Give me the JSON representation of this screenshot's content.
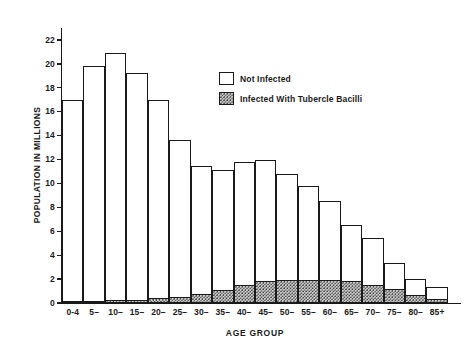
{
  "chart_data": {
    "type": "bar",
    "stacked": true,
    "title": "",
    "xlabel": "AGE GROUP",
    "ylabel": "POPULATION IN MILLIONS",
    "ylim": [
      0,
      23
    ],
    "yticks": [
      0,
      2,
      4,
      6,
      8,
      10,
      12,
      14,
      16,
      18,
      20,
      22
    ],
    "ytick_labels": [
      "0",
      "2",
      "4",
      "6",
      "8",
      "10",
      "12",
      "14",
      "16",
      "18",
      "20",
      "22"
    ],
    "grid": false,
    "legend_position": "upper-center-right",
    "categories": [
      "0-4",
      "5–",
      "10–",
      "15–",
      "20–",
      "25–",
      "30–",
      "35–",
      "40–",
      "45–",
      "50–",
      "55–",
      "60–",
      "65–",
      "70–",
      "75–",
      "80–",
      "85+"
    ],
    "series": [
      {
        "name": "Infected With Tubercle Bacilli",
        "fill": "stipple",
        "values": [
          0.1,
          0.12,
          0.15,
          0.2,
          0.3,
          0.45,
          0.65,
          1.0,
          1.4,
          1.75,
          1.8,
          1.85,
          1.85,
          1.75,
          1.45,
          1.05,
          0.6,
          0.25
        ]
      },
      {
        "name": "Not Infected",
        "fill": "white",
        "values": [
          16.9,
          19.68,
          20.75,
          19.0,
          16.7,
          13.15,
          10.85,
          10.1,
          10.4,
          10.25,
          9.0,
          7.95,
          6.65,
          4.75,
          3.95,
          2.3,
          1.4,
          1.05
        ]
      }
    ],
    "totals": [
      17.0,
      19.8,
      20.9,
      19.2,
      17.0,
      13.6,
      11.5,
      11.1,
      11.8,
      12.0,
      10.8,
      9.8,
      8.5,
      6.5,
      5.4,
      3.35,
      2.0,
      1.3
    ]
  },
  "legend": {
    "items": [
      {
        "label": "Not Infected",
        "fill": "white"
      },
      {
        "label": "Infected With Tubercle Bacilli",
        "fill": "stipple"
      }
    ]
  },
  "colors": {
    "axis": "#1a1a1a",
    "background": "#ffffff",
    "infected_fill": "#cfcfcf",
    "not_infected_fill": "#ffffff"
  }
}
